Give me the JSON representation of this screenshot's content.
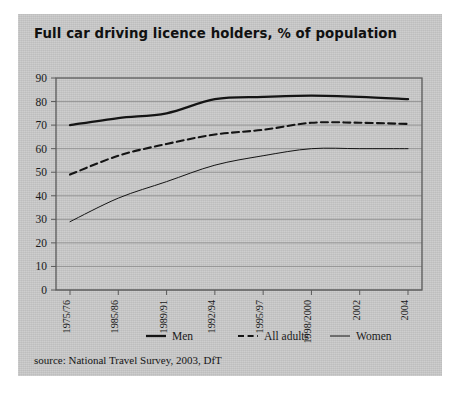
{
  "figure": {
    "title": "Full car driving licence holders, % of population",
    "source": "source: National Travel Survey, 2003, DfT",
    "background_color": "#c9c9c9",
    "axis_color": "#4a4a4a",
    "line_color": "#141414"
  },
  "chart_data": {
    "type": "line",
    "title": "Full car driving licence holders, % of population",
    "xlabel": "",
    "ylabel": "",
    "ylim": [
      0,
      90
    ],
    "yticks": [
      0,
      10,
      20,
      30,
      40,
      50,
      60,
      70,
      80,
      90
    ],
    "grid": true,
    "legend_position": "bottom",
    "categories": [
      "1975/76",
      "1985/86",
      "1989/91",
      "1992/94",
      "1995/97",
      "1998/2000",
      "2002",
      "2004"
    ],
    "series": [
      {
        "name": "Men",
        "style": "solid-thick",
        "values": [
          70,
          73,
          75,
          81,
          82,
          82.5,
          82,
          81
        ]
      },
      {
        "name": "All adults",
        "style": "dashed",
        "values": [
          49,
          57,
          62,
          66,
          68,
          71,
          71,
          70.5
        ]
      },
      {
        "name": "Women",
        "style": "solid-thin",
        "values": [
          29,
          39,
          46,
          53,
          57,
          60,
          60,
          60
        ]
      }
    ]
  },
  "legend": {
    "items": [
      {
        "label": "Men"
      },
      {
        "label": "All adults"
      },
      {
        "label": "Women"
      }
    ]
  }
}
